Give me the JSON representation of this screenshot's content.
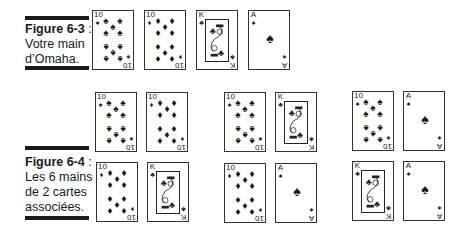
{
  "figures": [
    {
      "id": "fig-6-3",
      "label": "Figure 6-3",
      "separator": " :",
      "lines": [
        "Votre main",
        "d’Omaha."
      ],
      "hand": [
        {
          "rank": "10",
          "suit": "♠",
          "suit_name": "spades"
        },
        {
          "rank": "10",
          "suit": "♦",
          "suit_name": "diamonds"
        },
        {
          "rank": "K",
          "suit": "♣",
          "suit_name": "clubs"
        },
        {
          "rank": "A",
          "suit": "♠",
          "suit_name": "spades"
        }
      ]
    },
    {
      "id": "fig-6-4",
      "label": "Figure 6-4",
      "separator": " :",
      "lines": [
        "Les 6 mains",
        "de 2 cartes",
        "associées."
      ],
      "pairs": [
        [
          {
            "rank": "10",
            "suit": "♠"
          },
          {
            "rank": "10",
            "suit": "♦"
          }
        ],
        [
          {
            "rank": "10",
            "suit": "♠"
          },
          {
            "rank": "K",
            "suit": "♣"
          }
        ],
        [
          {
            "rank": "10",
            "suit": "♠"
          },
          {
            "rank": "A",
            "suit": "♠"
          }
        ],
        [
          {
            "rank": "10",
            "suit": "♦"
          },
          {
            "rank": "K",
            "suit": "♣"
          }
        ],
        [
          {
            "rank": "10",
            "suit": "♦"
          },
          {
            "rank": "A",
            "suit": "♠"
          }
        ],
        [
          {
            "rank": "K",
            "suit": "♣"
          },
          {
            "rank": "A",
            "suit": "♠"
          }
        ]
      ]
    }
  ],
  "colors": {
    "ink": "#1a1a1a",
    "card_border": "#333333",
    "background": "#ffffff"
  }
}
